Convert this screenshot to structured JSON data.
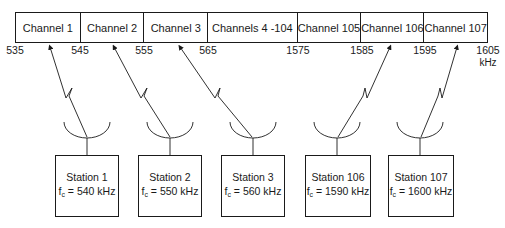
{
  "diagram": {
    "channels": [
      {
        "label": "Channel 1",
        "width": 65
      },
      {
        "label": "Channel 2",
        "width": 64
      },
      {
        "label": "Channel 3",
        "width": 64
      },
      {
        "label": "Channels 4 -104",
        "width": 90
      },
      {
        "label": "Channel 105",
        "width": 64
      },
      {
        "label": "Channel 106",
        "width": 63
      },
      {
        "label": "Channel 107",
        "width": 63
      }
    ],
    "ticks": [
      {
        "label": "535",
        "x": 15
      },
      {
        "label": "545",
        "x": 80
      },
      {
        "label": "555",
        "x": 144
      },
      {
        "label": "565",
        "x": 208
      },
      {
        "label": "1575",
        "x": 298
      },
      {
        "label": "1585",
        "x": 362
      },
      {
        "label": "1595",
        "x": 425
      },
      {
        "label": "1605",
        "x": 488
      }
    ],
    "unit": "kHz",
    "stations": [
      {
        "name": "Station 1",
        "fc_label": "f",
        "fc_sub": "c",
        "fc_value": " = 540 kHz",
        "box_x": 55,
        "dish_x": 87,
        "arrow_x": 50
      },
      {
        "name": "Station 2",
        "fc_label": "f",
        "fc_sub": "c",
        "fc_value": " = 550 kHz",
        "box_x": 138,
        "dish_x": 170,
        "arrow_x": 114
      },
      {
        "name": "Station 3",
        "fc_label": "f",
        "fc_sub": "c",
        "fc_value": " = 560 kHz",
        "box_x": 221,
        "dish_x": 253,
        "arrow_x": 180
      },
      {
        "name": "Station 106",
        "fc_label": "f",
        "fc_sub": "c",
        "fc_value": " = 1590 kHz",
        "box_x": 305,
        "dish_x": 337,
        "arrow_x": 390
      },
      {
        "name": "Station 107",
        "fc_label": "f",
        "fc_sub": "c",
        "fc_value": " = 1600 kHz",
        "box_x": 388,
        "dish_x": 420,
        "arrow_x": 457
      }
    ]
  }
}
